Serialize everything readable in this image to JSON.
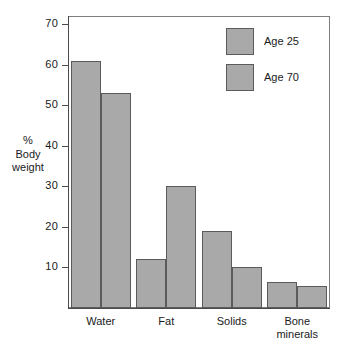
{
  "chart_data": {
    "type": "bar",
    "title": "",
    "xlabel": "",
    "ylabel": "% Body weight",
    "ylabel_lines": [
      "%",
      "Body",
      "weight"
    ],
    "categories": [
      "Water",
      "Fat",
      "Solids",
      "Bone minerals"
    ],
    "category_lines": [
      [
        "Water"
      ],
      [
        "Fat"
      ],
      [
        "Solids"
      ],
      [
        "Bone",
        "minerals"
      ]
    ],
    "series": [
      {
        "name": "Age 25",
        "values": [
          61,
          12,
          19,
          6.5
        ]
      },
      {
        "name": "Age 70",
        "values": [
          53,
          30,
          10,
          5.5
        ]
      }
    ],
    "ylim": [
      0,
      72
    ],
    "yticks": [
      10,
      20,
      30,
      40,
      50,
      60,
      70
    ],
    "ytick_labels": [
      "10",
      "20",
      "30",
      "40",
      "50",
      "60",
      "70"
    ],
    "grid": false,
    "legend_position": "top-right",
    "colors": {
      "bar_fill": "#a9a9a9",
      "bar_stroke": "#5b5b5b",
      "axis": "#4a4a4a",
      "frame": "#7d7d7d",
      "background": "#ffffff",
      "text": "#1a1a1a"
    }
  },
  "legend": {
    "entries": [
      {
        "label": "Age 25",
        "swatch": "legend-swatch-age-25"
      },
      {
        "label": "Age 70",
        "swatch": "legend-swatch-age-70"
      }
    ]
  }
}
